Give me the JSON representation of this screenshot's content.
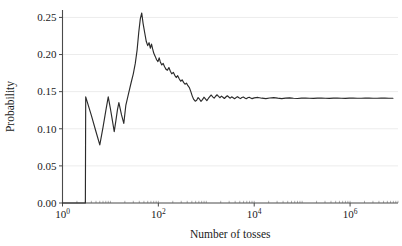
{
  "chart_data": {
    "type": "line",
    "title": "",
    "xlabel": "Number of tosses",
    "ylabel": "Probability",
    "xscale": "log10",
    "yscale": "linear",
    "xlim": [
      1,
      10000000
    ],
    "ylim": [
      0.0,
      0.26
    ],
    "grid": "horizontal",
    "legend": "none",
    "converges_to": 0.141,
    "peak_value": 0.256,
    "line_color": "#2b2b2b",
    "grid_color": "#ececec",
    "axis_color": "#4a4a4a",
    "xticks": [
      {
        "value": 1,
        "label": "10",
        "exponent": "0"
      },
      {
        "value": 100,
        "label": "10",
        "exponent": "2"
      },
      {
        "value": 10000,
        "label": "10",
        "exponent": "4"
      },
      {
        "value": 1000000,
        "label": "10",
        "exponent": "6"
      }
    ],
    "yticks": [
      {
        "value": 0.0,
        "label": "0.00"
      },
      {
        "value": 0.05,
        "label": "0.05"
      },
      {
        "value": 0.1,
        "label": "0.10"
      },
      {
        "value": 0.15,
        "label": "0.15"
      },
      {
        "value": 0.2,
        "label": "0.20"
      },
      {
        "value": 0.25,
        "label": "0.25"
      }
    ],
    "points": [
      [
        1,
        0.0
      ],
      [
        2,
        0.0
      ],
      [
        3,
        0.0
      ],
      [
        3.05,
        0.143
      ],
      [
        4,
        0.118
      ],
      [
        5,
        0.096
      ],
      [
        6,
        0.0782
      ],
      [
        7,
        0.102
      ],
      [
        8,
        0.124
      ],
      [
        9,
        0.143
      ],
      [
        10,
        0.127
      ],
      [
        11,
        0.111
      ],
      [
        12,
        0.0962
      ],
      [
        13,
        0.111
      ],
      [
        14,
        0.1255
      ],
      [
        15,
        0.1352
      ],
      [
        17,
        0.119
      ],
      [
        19,
        0.1072
      ],
      [
        21,
        0.132
      ],
      [
        24,
        0.148
      ],
      [
        27,
        0.162
      ],
      [
        30,
        0.174
      ],
      [
        33,
        0.188
      ],
      [
        36,
        0.206
      ],
      [
        39,
        0.23
      ],
      [
        42,
        0.248
      ],
      [
        45,
        0.256
      ],
      [
        48,
        0.242
      ],
      [
        52,
        0.229
      ],
      [
        56,
        0.2175
      ],
      [
        60,
        0.212
      ],
      [
        64,
        0.216
      ],
      [
        68,
        0.2085
      ],
      [
        72,
        0.214
      ],
      [
        76,
        0.2075
      ],
      [
        80,
        0.202
      ],
      [
        86,
        0.1975
      ],
      [
        92,
        0.193
      ],
      [
        98,
        0.1905
      ],
      [
        104,
        0.1955
      ],
      [
        110,
        0.19
      ],
      [
        118,
        0.186
      ],
      [
        126,
        0.188
      ],
      [
        135,
        0.1835
      ],
      [
        145,
        0.18
      ],
      [
        155,
        0.179
      ],
      [
        166,
        0.1825
      ],
      [
        178,
        0.1775
      ],
      [
        190,
        0.174
      ],
      [
        205,
        0.176
      ],
      [
        220,
        0.172
      ],
      [
        236,
        0.169
      ],
      [
        253,
        0.1715
      ],
      [
        272,
        0.1675
      ],
      [
        292,
        0.164
      ],
      [
        313,
        0.166
      ],
      [
        336,
        0.1625
      ],
      [
        360,
        0.16
      ],
      [
        386,
        0.1615
      ],
      [
        414,
        0.158
      ],
      [
        444,
        0.1555
      ],
      [
        476,
        0.15
      ],
      [
        510,
        0.144
      ],
      [
        547,
        0.1395
      ],
      [
        587,
        0.1372
      ],
      [
        630,
        0.1385
      ],
      [
        675,
        0.142
      ],
      [
        724,
        0.1398
      ],
      [
        777,
        0.137
      ],
      [
        833,
        0.1392
      ],
      [
        894,
        0.1425
      ],
      [
        959,
        0.1402
      ],
      [
        1028,
        0.138
      ],
      [
        1103,
        0.1408
      ],
      [
        1183,
        0.1432
      ],
      [
        1269,
        0.1455
      ],
      [
        1361,
        0.143
      ],
      [
        1460,
        0.1412
      ],
      [
        1566,
        0.1438
      ],
      [
        1680,
        0.1458
      ],
      [
        1802,
        0.1436
      ],
      [
        1933,
        0.1418
      ],
      [
        2073,
        0.144
      ],
      [
        2224,
        0.1425
      ],
      [
        2385,
        0.1408
      ],
      [
        2559,
        0.1428
      ],
      [
        2745,
        0.1445
      ],
      [
        2944,
        0.1428
      ],
      [
        3158,
        0.1412
      ],
      [
        3387,
        0.143
      ],
      [
        3633,
        0.1418
      ],
      [
        3897,
        0.1404
      ],
      [
        4180,
        0.142
      ],
      [
        4484,
        0.1432
      ],
      [
        4810,
        0.1418
      ],
      [
        5159,
        0.1406
      ],
      [
        5534,
        0.142
      ],
      [
        5936,
        0.1428
      ],
      [
        6367,
        0.1416
      ],
      [
        6830,
        0.1405
      ],
      [
        7326,
        0.1418
      ],
      [
        7858,
        0.1425
      ],
      [
        8429,
        0.1415
      ],
      [
        9042,
        0.1406
      ],
      [
        10000,
        0.1416
      ],
      [
        12000,
        0.1422
      ],
      [
        14500,
        0.1412
      ],
      [
        17500,
        0.1406
      ],
      [
        21000,
        0.1414
      ],
      [
        25500,
        0.1419
      ],
      [
        31000,
        0.1412
      ],
      [
        37500,
        0.1407
      ],
      [
        45000,
        0.1413
      ],
      [
        55000,
        0.1417
      ],
      [
        66000,
        0.1411
      ],
      [
        80000,
        0.1408
      ],
      [
        97000,
        0.1412
      ],
      [
        118000,
        0.1415
      ],
      [
        142000,
        0.1411
      ],
      [
        172000,
        0.1409
      ],
      [
        208000,
        0.1412
      ],
      [
        252000,
        0.1414
      ],
      [
        305000,
        0.1411
      ],
      [
        370000,
        0.141
      ],
      [
        448000,
        0.1412
      ],
      [
        542000,
        0.1413
      ],
      [
        656000,
        0.1411
      ],
      [
        794000,
        0.141
      ],
      [
        961000,
        0.1412
      ],
      [
        1163000,
        0.1412
      ],
      [
        1408000,
        0.1411
      ],
      [
        1704000,
        0.1411
      ],
      [
        2062000,
        0.1412
      ],
      [
        2496000,
        0.1412
      ],
      [
        3021000,
        0.1411
      ],
      [
        3656000,
        0.1411
      ],
      [
        4425000,
        0.1412
      ],
      [
        5355000,
        0.1412
      ],
      [
        6481000,
        0.1411
      ],
      [
        7843000,
        0.1411
      ]
    ]
  }
}
